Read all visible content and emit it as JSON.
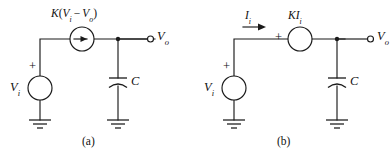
{
  "figure": {
    "kind": "circuit-diagram-pair",
    "background_color": "#ffffff",
    "line_color": "#1a1a1a",
    "text_color": "#111111"
  },
  "circuit_a": {
    "caption": "(a)",
    "source_label_main": "K",
    "source_label_expr": "(V",
    "dependent_source_text": "K(Vi − Vo)",
    "dependent_source_type": "current-source",
    "gain_prefix": "K",
    "paren_open": "(",
    "term1_var": "V",
    "term1_sub": "i",
    "minus_sign": "−",
    "term2_var": "V",
    "term2_sub": "o",
    "paren_close": ")",
    "input_source_var": "V",
    "input_source_sub": "i",
    "input_polarity": "+",
    "capacitor_label": "C",
    "output_var": "V",
    "output_sub": "o",
    "ground_count": 2
  },
  "circuit_b": {
    "caption": "(b)",
    "current_var": "I",
    "current_sub": "i",
    "dependent_source_text": "KIi",
    "dependent_source_type": "voltage-source",
    "gain_prefix": "K",
    "gain_var": "I",
    "gain_sub": "i",
    "source_polarity": "+",
    "input_source_var": "V",
    "input_source_sub": "i",
    "input_polarity": "+",
    "capacitor_label": "C",
    "output_var": "V",
    "output_sub": "o",
    "ground_count": 2
  }
}
